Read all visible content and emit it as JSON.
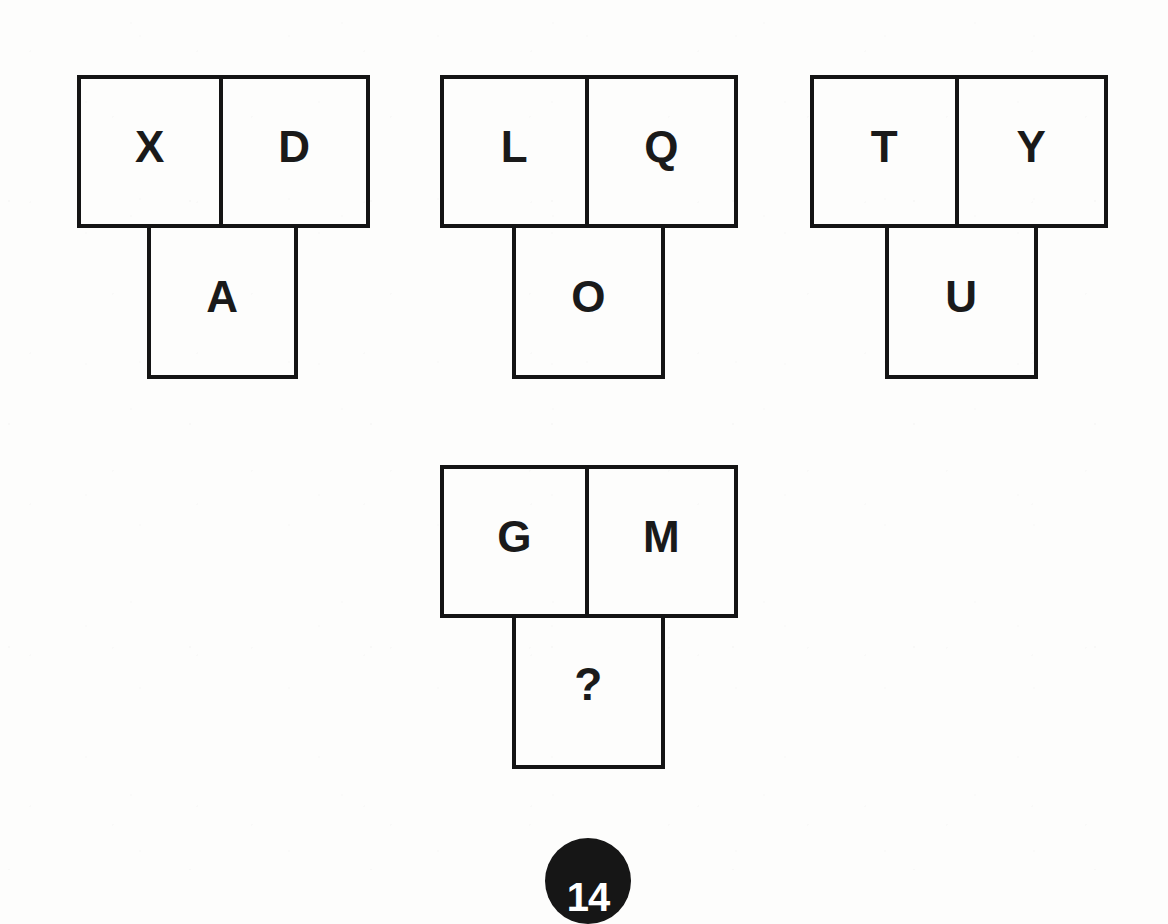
{
  "page": {
    "background_color": "#fdfdfc",
    "ink_color": "#141414",
    "badge_number": "14"
  },
  "puzzle": {
    "type": "letter-analogy",
    "answer_marker": "?",
    "groups": [
      {
        "id": "group-1",
        "role": "example",
        "top_left": "X",
        "top_right": "D",
        "bottom": "A",
        "geometry": {
          "x": 77,
          "y": 75,
          "cell_w": 146,
          "cell_h": 153,
          "bottom_offset_x": 70
        }
      },
      {
        "id": "group-2",
        "role": "example",
        "top_left": "L",
        "top_right": "Q",
        "bottom": "O",
        "geometry": {
          "x": 440,
          "y": 75,
          "cell_w": 149,
          "cell_h": 153,
          "bottom_offset_x": 72
        }
      },
      {
        "id": "group-3",
        "role": "example",
        "top_left": "T",
        "top_right": "Y",
        "bottom": "U",
        "geometry": {
          "x": 810,
          "y": 75,
          "cell_w": 149,
          "cell_h": 153,
          "bottom_offset_x": 75
        }
      },
      {
        "id": "group-4",
        "role": "question",
        "top_left": "G",
        "top_right": "M",
        "bottom": "?",
        "geometry": {
          "x": 440,
          "y": 465,
          "cell_w": 149,
          "cell_h": 153,
          "bottom_offset_x": 72
        }
      }
    ]
  }
}
